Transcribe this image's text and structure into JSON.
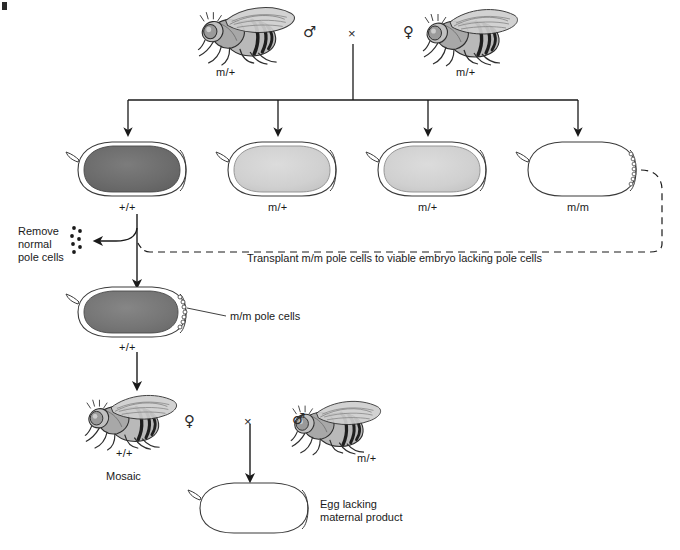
{
  "figure": {
    "background_color": "#ffffff",
    "line_color": "#1a1a1a",
    "corner_mark": "b"
  },
  "parent_cross": {
    "male_symbol": "♂",
    "female_symbol": "♀",
    "cross_symbol": "×",
    "male_genotype": "m/+",
    "female_genotype": "m/+",
    "male_icon": "fly-icon",
    "female_icon": "fly-icon"
  },
  "offspring_embryos": [
    {
      "genotype": "+/+",
      "fill": "#6e6e6e",
      "shade": "dark",
      "has_pole_cells": false
    },
    {
      "genotype": "m/+",
      "fill": "#d2d2d2",
      "shade": "light",
      "has_pole_cells": false
    },
    {
      "genotype": "m/+",
      "fill": "#c9c9c9",
      "shade": "light",
      "has_pole_cells": false
    },
    {
      "genotype": "m/m",
      "fill": "#ffffff",
      "shade": "white",
      "has_pole_cells": true
    }
  ],
  "remove_step": {
    "label_line1": "Remove",
    "label_line2": "normal",
    "label_line3": "pole cells",
    "pole_cell_dots": 7
  },
  "transplant_step": {
    "label": "Transplant m/m pole cells to viable embryo lacking pole cells"
  },
  "mosaic_embryo": {
    "genotype": "+/+",
    "fill": "#787878",
    "pole_cell_label": "m/m pole cells",
    "has_pole_cells": true
  },
  "adult_cross": {
    "female_symbol": "♀",
    "male_symbol": "♂",
    "cross_symbol": "×",
    "female_genotype": "+/+",
    "female_note": "Mosaic",
    "male_genotype": "m/+",
    "female_icon": "fly-icon",
    "male_icon": "fly-icon"
  },
  "final_egg": {
    "label_line1": "Egg lacking",
    "label_line2": "maternal product",
    "fill": "#ffffff"
  }
}
